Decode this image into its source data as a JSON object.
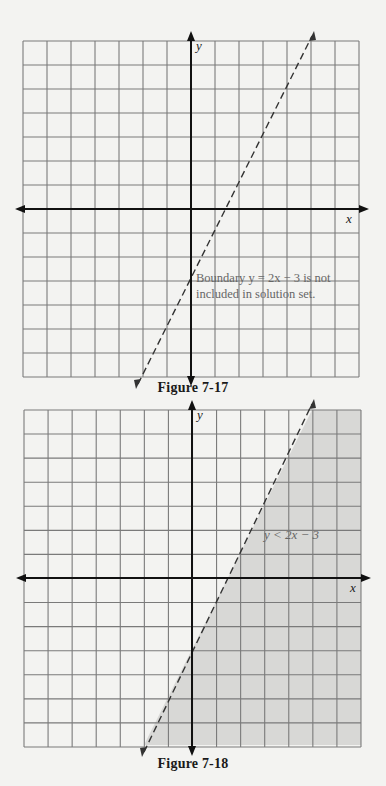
{
  "chart_data": [
    {
      "type": "line",
      "title": "Figure 7-17",
      "xlabel": "x",
      "ylabel": "y",
      "xlim": [
        -7,
        7
      ],
      "ylim": [
        -7,
        7
      ],
      "grid": true,
      "series": [
        {
          "name": "Boundary y = 2x - 3",
          "style": "dashed",
          "equation": "y = 2x - 3",
          "points": [
            [
              -2,
              -7
            ],
            [
              5,
              7
            ]
          ]
        }
      ],
      "annotations": [
        "Boundary y = 2x − 3 is not included in solution set."
      ],
      "shaded_region": null
    },
    {
      "type": "area",
      "title": "Figure 7-18",
      "xlabel": "x",
      "ylabel": "y",
      "xlim": [
        -7,
        7
      ],
      "ylim": [
        -7,
        7
      ],
      "grid": true,
      "series": [
        {
          "name": "Boundary y = 2x - 3",
          "style": "dashed",
          "equation": "y = 2x - 3",
          "points": [
            [
              -2,
              -7
            ],
            [
              5,
              7
            ]
          ]
        }
      ],
      "shaded_region": {
        "inequality": "y < 2x - 3",
        "side": "below/right of boundary",
        "color": "#d8d8d6"
      },
      "annotations": [
        "y < 2x − 3"
      ]
    }
  ],
  "figures": {
    "top": {
      "caption": "Figure 7-17",
      "x_label": "x",
      "y_label": "y",
      "note_line1": "Boundary y = 2x − 3 is not",
      "note_line2": "included in solution set."
    },
    "bottom": {
      "caption": "Figure 7-18",
      "x_label": "x",
      "y_label": "y",
      "region_label": "y < 2x − 3"
    }
  },
  "colors": {
    "background": "#f3f3f1",
    "grid": "#7a7a7a",
    "axis": "#111111",
    "boundary": "#333333",
    "shade": "#d8d8d6"
  }
}
